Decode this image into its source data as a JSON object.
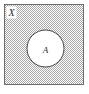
{
  "figure": {
    "name": "venn-diagram-complement",
    "width": 89,
    "height": 94
  },
  "universal_set": {
    "label": "X",
    "shape": "rectangle",
    "x": 4.5,
    "y": 4.5,
    "width": 79,
    "height": 80,
    "fill": "#d9d9d9",
    "hatch_color": "#9a9a9a",
    "border_color": "#6b6b6b",
    "label_x": 11.5,
    "label_y": 16,
    "label_font_size": 10,
    "label_box": {
      "x": 6.5,
      "y": 6.5,
      "width": 10,
      "height": 12,
      "fill": "#ffffff"
    }
  },
  "subset": {
    "label": "A",
    "shape": "circle",
    "cx": 45.5,
    "cy": 48.5,
    "r": 18.5,
    "fill": "#ffffff",
    "border_color": "#444444",
    "label_x": 45.5,
    "label_y": 52.5,
    "label_font_size": 9
  },
  "colors": {
    "background": "#ffffff",
    "shade": "#d9d9d9",
    "hatch": "#9a9a9a",
    "outline_outer": "#6b6b6b",
    "outline_inner": "#444444",
    "text": "#2b2b2b"
  }
}
